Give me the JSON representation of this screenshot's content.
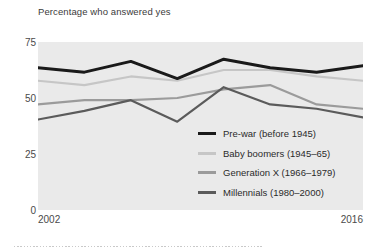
{
  "chart_data": {
    "type": "line",
    "title": "Percentage who answered yes",
    "xlabel": "",
    "ylabel": "",
    "ylim": [
      0,
      78
    ],
    "xlim": [
      2002,
      2016
    ],
    "grid": false,
    "legend_position": "inside-lower-right",
    "y_ticks": [
      "0",
      "25",
      "50",
      "75"
    ],
    "y_tick_values": [
      0,
      25,
      50,
      75
    ],
    "x_ticks": [
      "2002",
      "2016"
    ],
    "x": [
      2002,
      2004,
      2006,
      2008,
      2010,
      2012,
      2014,
      2016
    ],
    "series": [
      {
        "name": "Pre-war (before 1945)",
        "color": "#1a1a1a",
        "values": [
          66,
          64,
          69,
          61,
          70,
          66,
          64,
          67
        ]
      },
      {
        "name": "Baby boomers (1945–65)",
        "color": "#c6c6c6",
        "values": [
          60,
          58,
          62,
          60,
          65,
          65,
          62,
          60
        ]
      },
      {
        "name": "Generation X (1966–1979)",
        "color": "#9b9b9b",
        "values": [
          49,
          51,
          51,
          52,
          56,
          58,
          49,
          47
        ]
      },
      {
        "name": "Millennials (1980–2000)",
        "color": "#5b5b5b",
        "values": [
          42,
          46,
          51,
          41,
          57,
          49,
          47,
          43
        ]
      }
    ]
  },
  "legend": {
    "items": [
      {
        "label": "Pre-war (before 1945)",
        "color": "#1a1a1a"
      },
      {
        "label": "Baby boomers (1945–65)",
        "color": "#c6c6c6"
      },
      {
        "label": "Generation X (1966–1979)",
        "color": "#9b9b9b"
      },
      {
        "label": "Millennials (1980–2000)",
        "color": "#5b5b5b"
      }
    ]
  },
  "axis": {
    "y_labels": [
      "75",
      "50",
      "25",
      "0"
    ],
    "x_start": "2002",
    "x_end": "2016"
  },
  "colors": {
    "plot_background": "#eaeaea",
    "page_background": "#ffffff",
    "text": "#3b3b3b"
  }
}
